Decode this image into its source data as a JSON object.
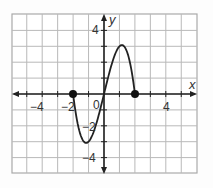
{
  "chart_data": {
    "type": "line",
    "title": "",
    "xlabel": "x",
    "ylabel": "y",
    "xlim": [
      -6,
      6
    ],
    "ylim": [
      -5,
      5
    ],
    "grid": true,
    "x_tick_labels": [
      "-4",
      "-2",
      "0",
      "4"
    ],
    "y_tick_labels": [
      "4",
      "-2",
      "-4"
    ],
    "series": [
      {
        "name": "f(x)",
        "domain": [
          -2,
          2
        ],
        "x": [
          -2,
          -1.5,
          -1,
          -0.5,
          0,
          0.5,
          1,
          1.5,
          2
        ],
        "values": [
          0,
          2.6,
          3.1,
          2.2,
          0,
          -2.2,
          -3.1,
          -2.6,
          0
        ],
        "endpoints": [
          {
            "x": -2,
            "y": 0,
            "closed": true
          },
          {
            "x": 2,
            "y": 0,
            "closed": true
          }
        ]
      }
    ]
  },
  "labels": {
    "x_axis": "x",
    "y_axis": "y",
    "origin": "0",
    "xm4": "−4",
    "xm2": "−2",
    "x4": "4",
    "y4": "4",
    "ym2": "−2",
    "ym4": "−4"
  }
}
